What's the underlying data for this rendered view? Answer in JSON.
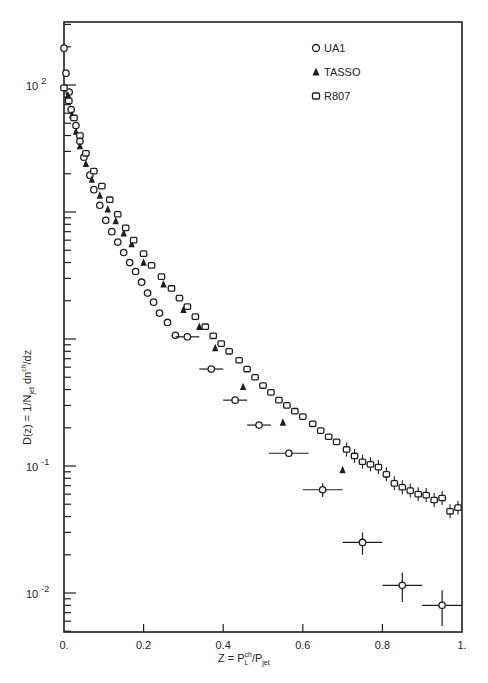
{
  "chart_data": {
    "type": "scatter",
    "title": "",
    "xlabel": "Z = P_L^ch / P_jet",
    "ylabel": "D(z) = 1/N_jet dn^ch/dz",
    "xlim": [
      0.0,
      1.0
    ],
    "ylim": [
      0.006,
      250
    ],
    "yscale": "log",
    "grid": false,
    "legend_position": "upper right",
    "x_ticks": [
      {
        "value": 0.0,
        "label": "0."
      },
      {
        "value": 0.2,
        "label": "0.2"
      },
      {
        "value": 0.4,
        "label": "0.4"
      },
      {
        "value": 0.6,
        "label": "0.6"
      },
      {
        "value": 0.8,
        "label": "0.8"
      },
      {
        "value": 1.0,
        "label": "1."
      }
    ],
    "y_ticks": [
      {
        "value": 100,
        "label": "10",
        "exp": "2"
      },
      {
        "value": 0.1,
        "label": "10",
        "exp": "-1"
      },
      {
        "value": 0.01,
        "label": "10",
        "exp": "-2"
      }
    ],
    "series": [
      {
        "name": "UA1",
        "marker": "open-circle",
        "points": [
          {
            "x": 0.0,
            "y": 195
          },
          {
            "x": 0.005,
            "y": 124
          },
          {
            "x": 0.013,
            "y": 88
          },
          {
            "x": 0.018,
            "y": 64
          },
          {
            "x": 0.03,
            "y": 48
          },
          {
            "x": 0.04,
            "y": 36
          },
          {
            "x": 0.05,
            "y": 27
          },
          {
            "x": 0.065,
            "y": 19.5
          },
          {
            "x": 0.075,
            "y": 15
          },
          {
            "x": 0.09,
            "y": 11.3
          },
          {
            "x": 0.105,
            "y": 8.6
          },
          {
            "x": 0.12,
            "y": 7.0
          },
          {
            "x": 0.135,
            "y": 5.8
          },
          {
            "x": 0.15,
            "y": 4.8
          },
          {
            "x": 0.165,
            "y": 4.0
          },
          {
            "x": 0.18,
            "y": 3.4
          },
          {
            "x": 0.195,
            "y": 2.8
          },
          {
            "x": 0.21,
            "y": 2.3
          },
          {
            "x": 0.225,
            "y": 1.95
          },
          {
            "x": 0.24,
            "y": 1.6
          },
          {
            "x": 0.26,
            "y": 1.35
          },
          {
            "x": 0.28,
            "y": 1.07
          },
          {
            "x": 0.31,
            "y": 1.04,
            "xerr": 0.03
          },
          {
            "x": 0.37,
            "y": 0.58,
            "xerr": 0.03
          },
          {
            "x": 0.43,
            "y": 0.33,
            "xerr": 0.03
          },
          {
            "x": 0.49,
            "y": 0.21,
            "xerr": 0.03
          },
          {
            "x": 0.565,
            "y": 0.126,
            "xerr": 0.05
          },
          {
            "x": 0.65,
            "y": 0.065,
            "xerr": 0.05,
            "yerr": 0.008
          },
          {
            "x": 0.75,
            "y": 0.025,
            "xerr": 0.05,
            "yerr": 0.005
          },
          {
            "x": 0.85,
            "y": 0.0115,
            "xerr": 0.05,
            "yerr": 0.003
          },
          {
            "x": 0.95,
            "y": 0.008,
            "xerr": 0.05,
            "yerr": 0.0025
          }
        ]
      },
      {
        "name": "TASSO",
        "marker": "filled-triangle",
        "points": [
          {
            "x": 0.01,
            "y": 83
          },
          {
            "x": 0.02,
            "y": 58
          },
          {
            "x": 0.03,
            "y": 43
          },
          {
            "x": 0.04,
            "y": 33
          },
          {
            "x": 0.055,
            "y": 24
          },
          {
            "x": 0.07,
            "y": 18
          },
          {
            "x": 0.09,
            "y": 13.5
          },
          {
            "x": 0.11,
            "y": 10.5
          },
          {
            "x": 0.13,
            "y": 8.5
          },
          {
            "x": 0.15,
            "y": 6.8
          },
          {
            "x": 0.17,
            "y": 5.6
          },
          {
            "x": 0.2,
            "y": 4.0
          },
          {
            "x": 0.25,
            "y": 2.7
          },
          {
            "x": 0.3,
            "y": 1.7
          },
          {
            "x": 0.34,
            "y": 1.25
          },
          {
            "x": 0.38,
            "y": 0.85
          },
          {
            "x": 0.45,
            "y": 0.42
          },
          {
            "x": 0.55,
            "y": 0.22
          },
          {
            "x": 0.7,
            "y": 0.093
          }
        ]
      },
      {
        "name": "R807",
        "marker": "open-square",
        "points": [
          {
            "x": 0.0,
            "y": 95
          },
          {
            "x": 0.012,
            "y": 75
          },
          {
            "x": 0.025,
            "y": 55
          },
          {
            "x": 0.04,
            "y": 40
          },
          {
            "x": 0.055,
            "y": 29
          },
          {
            "x": 0.075,
            "y": 21
          },
          {
            "x": 0.095,
            "y": 16
          },
          {
            "x": 0.115,
            "y": 12.5
          },
          {
            "x": 0.135,
            "y": 9.6
          },
          {
            "x": 0.155,
            "y": 7.5
          },
          {
            "x": 0.175,
            "y": 6.0
          },
          {
            "x": 0.2,
            "y": 4.7
          },
          {
            "x": 0.22,
            "y": 3.8
          },
          {
            "x": 0.245,
            "y": 3.1
          },
          {
            "x": 0.27,
            "y": 2.5
          },
          {
            "x": 0.29,
            "y": 2.1
          },
          {
            "x": 0.31,
            "y": 1.8
          },
          {
            "x": 0.33,
            "y": 1.5
          },
          {
            "x": 0.355,
            "y": 1.25
          },
          {
            "x": 0.375,
            "y": 1.06
          },
          {
            "x": 0.395,
            "y": 0.92
          },
          {
            "x": 0.415,
            "y": 0.8
          },
          {
            "x": 0.44,
            "y": 0.68
          },
          {
            "x": 0.46,
            "y": 0.58
          },
          {
            "x": 0.48,
            "y": 0.5
          },
          {
            "x": 0.5,
            "y": 0.43
          },
          {
            "x": 0.52,
            "y": 0.38
          },
          {
            "x": 0.54,
            "y": 0.33
          },
          {
            "x": 0.56,
            "y": 0.3
          },
          {
            "x": 0.58,
            "y": 0.27
          },
          {
            "x": 0.6,
            "y": 0.245
          },
          {
            "x": 0.625,
            "y": 0.215
          },
          {
            "x": 0.645,
            "y": 0.19
          },
          {
            "x": 0.665,
            "y": 0.17
          },
          {
            "x": 0.685,
            "y": 0.155
          },
          {
            "x": 0.71,
            "y": 0.135
          },
          {
            "x": 0.73,
            "y": 0.12
          },
          {
            "x": 0.75,
            "y": 0.108
          },
          {
            "x": 0.77,
            "y": 0.103
          },
          {
            "x": 0.79,
            "y": 0.098
          },
          {
            "x": 0.81,
            "y": 0.086
          },
          {
            "x": 0.83,
            "y": 0.073
          },
          {
            "x": 0.85,
            "y": 0.068
          },
          {
            "x": 0.87,
            "y": 0.064
          },
          {
            "x": 0.89,
            "y": 0.06
          },
          {
            "x": 0.91,
            "y": 0.059
          },
          {
            "x": 0.93,
            "y": 0.054
          },
          {
            "x": 0.95,
            "y": 0.056
          },
          {
            "x": 0.97,
            "y": 0.044
          },
          {
            "x": 0.99,
            "y": 0.047
          }
        ]
      }
    ],
    "legend": [
      {
        "label": "UA1",
        "marker": "open-circle"
      },
      {
        "label": "TASSO",
        "marker": "filled-triangle"
      },
      {
        "label": "R807",
        "marker": "open-square"
      }
    ]
  },
  "labels": {
    "xlabel_main": "Z  =  P",
    "xlabel_sub_L": "L",
    "xlabel_sup_ch": "ch",
    "xlabel_slash": "/P",
    "xlabel_sub_jet": "jet",
    "ylabel_main": "D(z)  =  1/N",
    "ylabel_sub_jet": "jet",
    "ylabel_rest": " dn",
    "ylabel_sup_ch": "ch",
    "ylabel_end": "/dz"
  },
  "style": {
    "ink": "#1e1e1e",
    "background": "#ffffff"
  }
}
